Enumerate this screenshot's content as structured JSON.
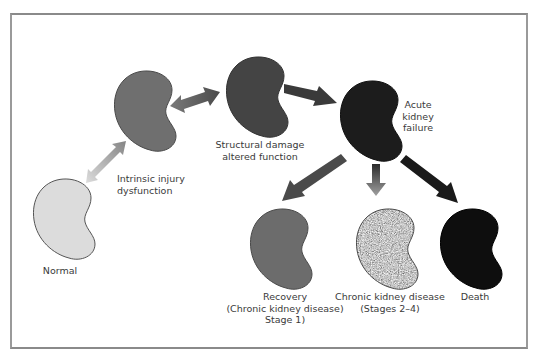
{
  "diagram": {
    "title": "",
    "nodes": [
      {
        "id": "normal",
        "label_lines": [
          "Normal"
        ],
        "fill": "#d9d9d9"
      },
      {
        "id": "intrinsic",
        "label_lines": [
          "Intrinsic injury",
          "dysfunction"
        ],
        "fill": "#707070"
      },
      {
        "id": "structural",
        "label_lines": [
          "Structural damage",
          "altered function"
        ],
        "fill": "#474747"
      },
      {
        "id": "akf",
        "label_lines": [
          "Acute",
          "kidney",
          "failure"
        ],
        "fill": "#1e1e1e"
      },
      {
        "id": "recovery",
        "label_lines": [
          "Recovery",
          "(Chronic kidney disease)",
          "Stage 1)"
        ],
        "fill": "#6e6e6e"
      },
      {
        "id": "ckd",
        "label_lines": [
          "Chronic kidney disease",
          "(Stages 2–4)"
        ],
        "fill": "#8a8a8a"
      },
      {
        "id": "death",
        "label_lines": [
          "Death"
        ],
        "fill": "#111111"
      }
    ],
    "edges": [
      {
        "from": "normal",
        "to": "intrinsic",
        "type": "bidirectional",
        "color_start": "#d8d8d8",
        "color_end": "#888888"
      },
      {
        "from": "intrinsic",
        "to": "structural",
        "type": "bidirectional",
        "color_start": "#7a7a7a",
        "color_end": "#4a4a4a"
      },
      {
        "from": "structural",
        "to": "akf",
        "type": "directed",
        "color": "#3a3a3a"
      },
      {
        "from": "akf",
        "to": "recovery",
        "type": "directed",
        "color": "#4a4a4a"
      },
      {
        "from": "akf",
        "to": "ckd",
        "type": "directed",
        "color_start": "#2a2a2a",
        "color_end": "#9a9a9a"
      },
      {
        "from": "akf",
        "to": "death",
        "type": "directed",
        "color": "#1a1a1a"
      }
    ]
  }
}
